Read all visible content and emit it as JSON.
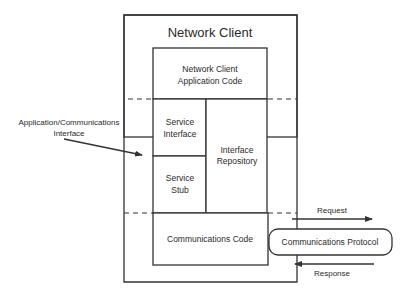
{
  "diagram": {
    "outer_box": {
      "title": "Network Client"
    },
    "blocks": {
      "app_code": {
        "line1": "Network Client",
        "line2": "Application Code"
      },
      "service_interface": {
        "line1": "Service",
        "line2": "Interface"
      },
      "service_stub": {
        "line1": "Service",
        "line2": "Stub"
      },
      "interface_repository": {
        "line1": "Interface",
        "line2": "Repository"
      },
      "communications_code": {
        "label": "Communications Code"
      }
    },
    "external": {
      "protocol": {
        "label": "Communications Protocol"
      },
      "request": {
        "label": "Request"
      },
      "response": {
        "label": "Response"
      },
      "app_comm_interface": {
        "line1": "Application/Communications",
        "line2": "Interface"
      }
    },
    "colors": {
      "line": "#333333",
      "background": "#ffffff"
    }
  }
}
